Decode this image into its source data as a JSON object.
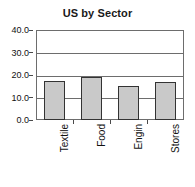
{
  "chart_data": {
    "type": "bar",
    "title": "US by Sector",
    "xlabel": "",
    "ylabel": "",
    "categories": [
      "Textile",
      "Food",
      "Engin",
      "Stores"
    ],
    "values": [
      17.3,
      19.3,
      15.0,
      17.0
    ],
    "ylim": [
      0.0,
      40.0
    ],
    "yticks": [
      "0.0",
      "10.0",
      "20.0",
      "30.0",
      "40.0"
    ],
    "ytick_values": [
      0.0,
      10.0,
      20.0,
      30.0,
      40.0
    ],
    "grid": true,
    "legend": false,
    "legend_position": "none",
    "series": [
      {
        "name": "US by Sector",
        "values": [
          17.3,
          19.3,
          15.0,
          17.0
        ]
      }
    ],
    "colors": {
      "bar_fill": "#c9c9c9",
      "bar_border": "#333333",
      "axis": "#6d6d6d",
      "text": "#111111",
      "background": "#ffffff"
    }
  }
}
